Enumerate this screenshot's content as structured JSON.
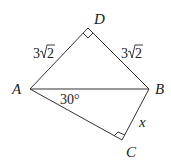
{
  "diagram": {
    "type": "quadrilateral with diagonal",
    "vertices": {
      "A": {
        "label": "A",
        "x": 30,
        "y": 89
      },
      "B": {
        "label": "B",
        "x": 149,
        "y": 89
      },
      "C": {
        "label": "C",
        "x": 122,
        "y": 140
      },
      "D": {
        "label": "D",
        "x": 88,
        "y": 28
      }
    },
    "edges": [
      {
        "from": "A",
        "to": "D",
        "label": "3√2"
      },
      {
        "from": "D",
        "to": "B",
        "label": "3√2"
      },
      {
        "from": "A",
        "to": "B",
        "label": ""
      },
      {
        "from": "A",
        "to": "C",
        "label": ""
      },
      {
        "from": "C",
        "to": "B",
        "label": "x"
      }
    ],
    "labels": {
      "AD_coef": "3",
      "AD_rad": "2",
      "DB_coef": "3",
      "DB_rad": "2",
      "CB": "x",
      "angle_BAC": "30°"
    },
    "right_angles": [
      "D",
      "C"
    ],
    "colors": {
      "stroke": "#333333",
      "background": "#ffffff"
    }
  }
}
